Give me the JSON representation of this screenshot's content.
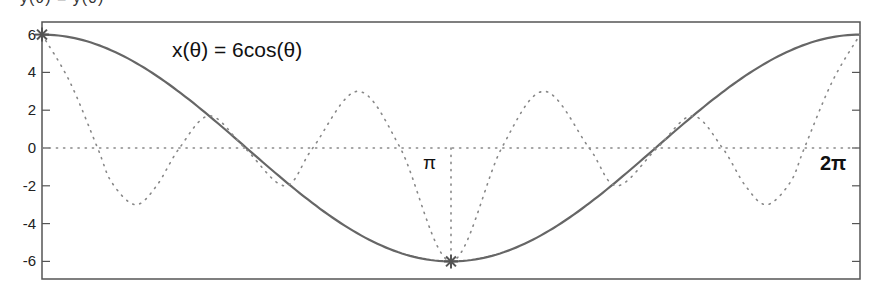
{
  "chart_data": {
    "type": "line",
    "title": "",
    "xlabel": "",
    "ylabel": "",
    "xlim": [
      0,
      6.2832
    ],
    "ylim": [
      -7,
      6.75
    ],
    "grid": false,
    "legend": null,
    "yticks": [
      6,
      4,
      2,
      0,
      -2,
      -4,
      -6
    ],
    "ytick_labels": [
      "6",
      "4",
      "2",
      "0",
      "-2",
      "-4",
      "-6"
    ],
    "annotations": [
      {
        "text": "x(θ) = 6cos(θ)",
        "x_theta": 1.05,
        "y": 4.6,
        "bold": false
      },
      {
        "text": "π",
        "x_theta": 3.05,
        "y": -0.9,
        "bold": false
      },
      {
        "text": "2π",
        "x_theta": 6.02,
        "y": -0.9,
        "bold": true
      }
    ],
    "series": [
      {
        "name": "x(θ) = 6cos(θ)",
        "style": "solid",
        "color": "#666666",
        "function": "6cos(θ)",
        "x": [
          0,
          0.3927,
          0.7854,
          1.1781,
          1.5708,
          1.9635,
          2.3562,
          2.7489,
          3.1416,
          3.5343,
          3.927,
          4.3197,
          4.7124,
          5.1051,
          5.4978,
          5.8905,
          6.2832
        ],
        "values": [
          6,
          5.54,
          4.24,
          2.3,
          0,
          -2.3,
          -4.24,
          -5.54,
          -6,
          -5.54,
          -4.24,
          -2.3,
          0,
          2.3,
          4.24,
          5.54,
          6
        ]
      },
      {
        "name": "dotted oscillation",
        "style": "dotted",
        "color": "#888888",
        "x": [
          0,
          0.214,
          0.427,
          0.534,
          0.716,
          0.88,
          1.056,
          1.288,
          1.558,
          1.866,
          2.08,
          2.425,
          2.752,
          3.1416,
          3.531,
          3.858,
          4.203,
          4.417,
          4.725,
          4.995,
          5.227,
          5.403,
          5.567,
          5.749,
          5.856,
          6.069,
          6.2832
        ],
        "values": [
          6,
          3.5,
          0,
          -1.8,
          -3,
          -2,
          0,
          1.7,
          0,
          -2,
          0,
          3,
          0,
          -6,
          0,
          3,
          0,
          -2,
          0,
          1.7,
          0,
          -2,
          -3,
          -1.8,
          0,
          3.5,
          6
        ]
      },
      {
        "name": "zero line",
        "style": "dotted",
        "color": "#888888",
        "x": [
          0,
          6.2832
        ],
        "values": [
          0,
          0
        ]
      },
      {
        "name": "pi marker line",
        "style": "dotted",
        "color": "#888888",
        "x": [
          3.1416,
          3.1416
        ],
        "values": [
          0,
          -6
        ]
      }
    ],
    "markers": [
      {
        "shape": "asterisk",
        "x": 0,
        "y": 6,
        "color": "#555555"
      },
      {
        "shape": "asterisk",
        "x": 3.1416,
        "y": -6,
        "color": "#555555"
      }
    ]
  },
  "top_cut_text": "y(θ) = y(0)"
}
